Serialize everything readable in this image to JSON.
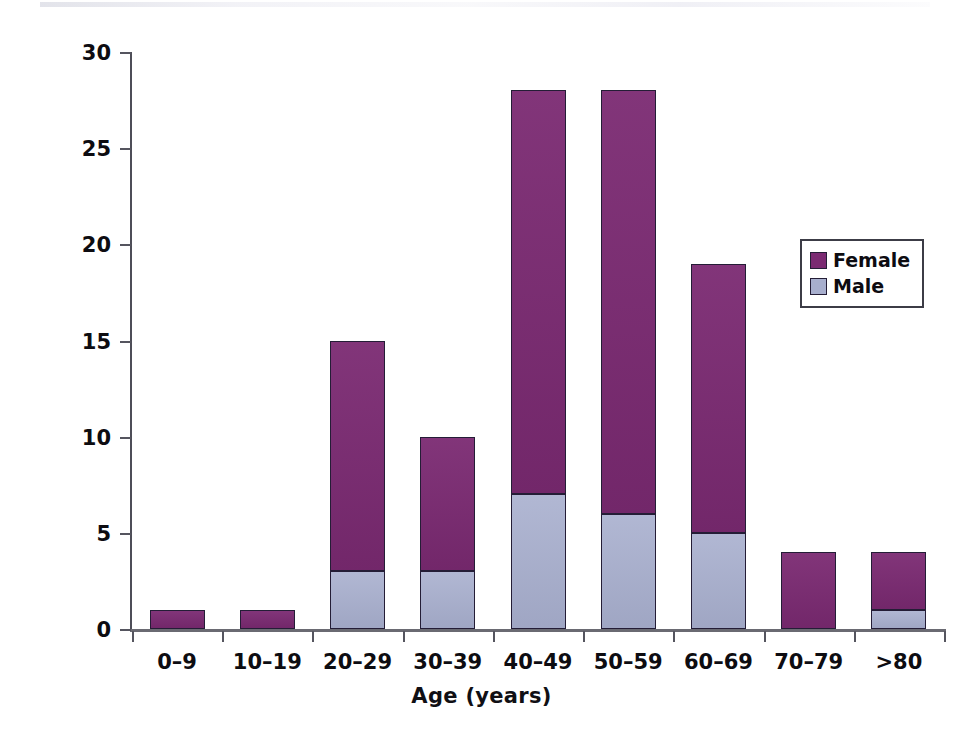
{
  "chart_data": {
    "type": "bar",
    "subtype": "stacked-vertical",
    "title": "",
    "xlabel": "Age (years)",
    "ylabel": "Number of patients",
    "categories": [
      "0–9",
      "10–19",
      "20–29",
      "30–39",
      "40–49",
      "50–59",
      "60–69",
      "70–79",
      ">80"
    ],
    "series": [
      {
        "name": "Male",
        "color": "#a8afce",
        "values": [
          0,
          0,
          3,
          3,
          7,
          6,
          5,
          0,
          1
        ]
      },
      {
        "name": "Female",
        "color": "#7b2a72",
        "values": [
          1,
          1,
          12,
          7,
          21,
          22,
          14,
          4,
          3
        ]
      }
    ],
    "stack_order": [
      "Male",
      "Female"
    ],
    "totals": [
      1,
      1,
      15,
      10,
      28,
      28,
      19,
      4,
      4
    ],
    "ylim": [
      0,
      30
    ],
    "yticks": [
      0,
      5,
      10,
      15,
      20,
      25,
      30
    ],
    "ytick_labels": [
      "0",
      "5",
      "10",
      "15",
      "20",
      "25",
      "30"
    ],
    "grid": false,
    "legend_position": "top-right",
    "legend_entries": [
      "Female",
      "Male"
    ]
  },
  "legend": {
    "items": [
      {
        "label": "Female",
        "color": "#7b2a72"
      },
      {
        "label": "Male",
        "color": "#a8afce"
      }
    ]
  },
  "axes": {
    "y_title": "Number of patients",
    "x_title": "Age (years)"
  },
  "colors": {
    "female": "#7b2a72",
    "male": "#a8afce",
    "axis": "#55555f",
    "bar_outline": "#241d36",
    "text": "#0d0c11"
  }
}
